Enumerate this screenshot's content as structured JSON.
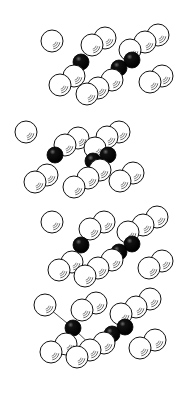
{
  "diagram": {
    "colors": {
      "background": "#ffffff",
      "outline": "#111111",
      "white_atom_fill": "#ffffff",
      "black_atom_fill": "#0a0a0a",
      "bond": "#333333"
    },
    "white_radius": 11,
    "black_radius": 8,
    "panels": [
      {
        "id": "panel-1",
        "white_atoms": [
          [
            52,
            41
          ],
          [
            92,
            45
          ],
          [
            105,
            38
          ],
          [
            130,
            50
          ],
          [
            145,
            42
          ],
          [
            158,
            35
          ],
          [
            74,
            76
          ],
          [
            60,
            85
          ],
          [
            112,
            80
          ],
          [
            98,
            88
          ],
          [
            87,
            94
          ],
          [
            162,
            76
          ],
          [
            150,
            82
          ]
        ],
        "black_atoms": [
          [
            81,
            62
          ],
          [
            132,
            60
          ],
          [
            119,
            68
          ]
        ],
        "bonds": []
      },
      {
        "id": "panel-2",
        "white_atoms": [
          [
            26,
            132
          ],
          [
            78,
            138
          ],
          [
            65,
            145
          ],
          [
            119,
            132
          ],
          [
            107,
            137
          ],
          [
            95,
            148
          ],
          [
            47,
            175
          ],
          [
            35,
            182
          ],
          [
            100,
            170
          ],
          [
            88,
            178
          ],
          [
            74,
            187
          ],
          [
            133,
            173
          ],
          [
            120,
            181
          ]
        ],
        "black_atoms": [
          [
            55,
            155
          ],
          [
            108,
            155
          ],
          [
            93,
            161
          ]
        ],
        "bonds": []
      },
      {
        "id": "panel-3",
        "white_atoms": [
          [
            52,
            222
          ],
          [
            104,
            222
          ],
          [
            90,
            229
          ],
          [
            157,
            217
          ],
          [
            143,
            225
          ],
          [
            128,
            232
          ],
          [
            72,
            262
          ],
          [
            59,
            270
          ],
          [
            112,
            260
          ],
          [
            98,
            268
          ],
          [
            85,
            276
          ],
          [
            162,
            261
          ],
          [
            149,
            268
          ]
        ],
        "black_atoms": [
          [
            81,
            245
          ],
          [
            132,
            244
          ],
          [
            119,
            252
          ]
        ],
        "bonds": []
      },
      {
        "id": "panel-4",
        "white_atoms": [
          [
            45,
            305
          ],
          [
            96,
            303
          ],
          [
            82,
            310
          ],
          [
            150,
            299
          ],
          [
            136,
            307
          ],
          [
            121,
            314
          ],
          [
            66,
            344
          ],
          [
            51,
            352
          ],
          [
            104,
            343
          ],
          [
            90,
            350
          ],
          [
            77,
            357
          ],
          [
            155,
            340
          ],
          [
            140,
            348
          ]
        ],
        "black_atoms": [
          [
            73,
            328
          ],
          [
            125,
            327
          ],
          [
            112,
            334
          ]
        ],
        "bonds": [
          [
            [
              73,
              328
            ],
            [
              45,
              305
            ]
          ],
          [
            [
              73,
              328
            ],
            [
              98,
              352
            ]
          ],
          [
            [
              73,
              328
            ],
            [
              58,
              350
            ]
          ]
        ]
      }
    ]
  }
}
